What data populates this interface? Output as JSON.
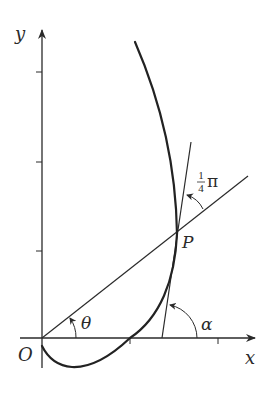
{
  "diagram": {
    "type": "polar-curve-tangent-angle",
    "axes": {
      "x_label": "x",
      "y_label": "y",
      "origin_label": "O",
      "y_ticks": 3,
      "x_ticks": 2
    },
    "point": {
      "label": "P"
    },
    "angles": {
      "theta": "θ",
      "alpha": "α",
      "psi_label_num": "1",
      "psi_label_den": "4",
      "psi_label_sym": "π"
    },
    "colors": {
      "ink": "#2a2a2a",
      "curve": "#222222",
      "background": "#ffffff"
    }
  }
}
